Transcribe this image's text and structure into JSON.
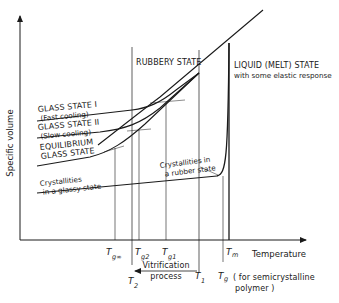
{
  "diagram": {
    "title": "",
    "axes": {
      "y_label": "Specific volume",
      "x_label": "Temperature"
    },
    "regions": {
      "rubbery": "RUBBERY STATE",
      "liquid_line1": "LIQUID (MELT) STATE",
      "liquid_line2": "with some elastic response"
    },
    "curve_labels": {
      "glass1_line1": "GLASS STATE I",
      "glass1_line2": "(Fast cooling)",
      "glass2_line1": "GLASS STATE II",
      "glass2_line2": "(Slow cooling)",
      "equil_line1": "EQUILIBRIUM",
      "equil_line2": "GLASS STATE",
      "cryst_glassy_line1": "Crystallities",
      "cryst_glassy_line2": "in a glassy state",
      "cryst_rubber_line1": "Crystallities in",
      "cryst_rubber_line2": "a rubber state"
    },
    "ticks": {
      "tg_inf": {
        "main": "T",
        "sub": "g∞"
      },
      "tg2": {
        "main": "T",
        "sub": "g2"
      },
      "tg1": {
        "main": "T",
        "sub": "g1"
      },
      "tm": {
        "main": "T",
        "sub": "m"
      },
      "t2": {
        "main": "T",
        "sub": "2"
      },
      "t1": {
        "main": "T",
        "sub": "1"
      },
      "tg": {
        "main": "T",
        "sub": "g"
      }
    },
    "annotations": {
      "vitrification_line1": "Vitrification",
      "vitrification_line2": "process",
      "tg_note_line1": "( for semicrystalline",
      "tg_note_line2": "polymer )"
    },
    "colors": {
      "ink": "#1a1a1a",
      "background": "#ffffff"
    }
  }
}
